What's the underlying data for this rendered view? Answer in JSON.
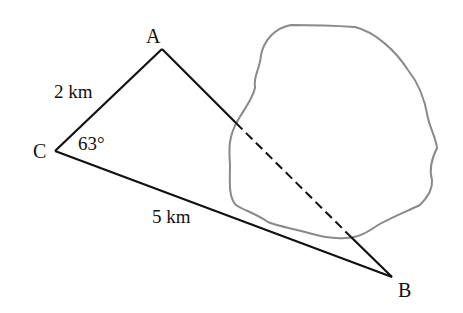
{
  "diagram": {
    "type": "geometry-triangle",
    "vertices": {
      "A": {
        "label": "A",
        "x": 162,
        "y": 49
      },
      "B": {
        "label": "B",
        "x": 392,
        "y": 277
      },
      "C": {
        "label": "C",
        "x": 55,
        "y": 151
      }
    },
    "sides": {
      "CA": {
        "label": "2 km",
        "style": "solid"
      },
      "CB": {
        "label": "5 km",
        "style": "solid"
      },
      "AB": {
        "label": "",
        "style": "solid-dashed-through-obstacle"
      }
    },
    "angles": {
      "C": {
        "label": "63°"
      }
    },
    "obstacle": {
      "description": "irregular closed region (lake) crossed by side AB",
      "stroke": "#8a8a8a"
    },
    "colors": {
      "line": "#111111",
      "obstacle": "#8a8a8a",
      "background": "#ffffff"
    }
  }
}
